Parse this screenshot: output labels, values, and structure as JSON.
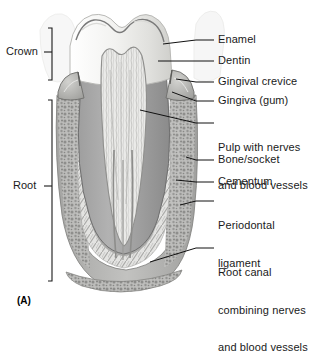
{
  "figure": {
    "id": "(A)",
    "background": "#ffffff"
  },
  "brackets": [
    {
      "name": "crown",
      "label": "Crown",
      "top": 28,
      "bottom": 80,
      "x": 52,
      "label_x": 6,
      "label_y": 48
    },
    {
      "name": "root",
      "label": "Root",
      "top": 100,
      "bottom": 281,
      "x": 52,
      "label_x": 11,
      "label_y": 185
    }
  ],
  "labels": [
    {
      "name": "enamel",
      "lines": [
        "Enamel"
      ],
      "x": 218,
      "y": 36,
      "leader": [
        [
          196,
          40
        ],
        [
          214,
          40
        ]
      ],
      "tip": [
        163,
        44
      ]
    },
    {
      "name": "dentin",
      "lines": [
        "Dentin"
      ],
      "x": 218,
      "y": 57,
      "leader": [
        [
          196,
          61
        ],
        [
          214,
          61
        ]
      ],
      "tip": [
        158,
        61
      ]
    },
    {
      "name": "gingival-crevice",
      "lines": [
        "Gingival crevice"
      ],
      "x": 218,
      "y": 78,
      "leader": [
        [
          196,
          82
        ],
        [
          214,
          82
        ]
      ],
      "tip": [
        172,
        79
      ]
    },
    {
      "name": "gingiva-gum",
      "lines": [
        "Gingiva (gum)"
      ],
      "x": 218,
      "y": 97,
      "leader": [
        [
          196,
          101
        ],
        [
          214,
          101
        ]
      ],
      "tip": [
        170,
        92
      ]
    },
    {
      "name": "pulp",
      "lines": [
        "Pulp with nerves",
        "and blood vessels"
      ],
      "x": 218,
      "y": 119,
      "leader": [
        [
          196,
          123
        ],
        [
          214,
          123
        ]
      ],
      "tip": [
        140,
        110
      ]
    },
    {
      "name": "bone-socket",
      "lines": [
        "Bone/socket"
      ],
      "x": 218,
      "y": 156,
      "leader": [
        [
          196,
          160
        ],
        [
          214,
          160
        ]
      ],
      "tip": [
        185,
        157
      ]
    },
    {
      "name": "cementum",
      "lines": [
        "Cementum"
      ],
      "x": 218,
      "y": 178,
      "leader": [
        [
          196,
          182
        ],
        [
          214,
          182
        ]
      ],
      "tip": [
        176,
        180
      ]
    },
    {
      "name": "periodontal-ligament",
      "lines": [
        "Periodontal",
        "ligament"
      ],
      "x": 218,
      "y": 197,
      "leader": [
        [
          196,
          201
        ],
        [
          214,
          201
        ]
      ],
      "tip": [
        180,
        204
      ]
    },
    {
      "name": "root-canal",
      "lines": [
        "Root canal",
        "combining nerves",
        "and blood vessels"
      ],
      "x": 218,
      "y": 244,
      "leader": [
        [
          196,
          248
        ],
        [
          214,
          248
        ]
      ],
      "tip": [
        150,
        262
      ]
    }
  ],
  "anatomy": {
    "colors": {
      "enamel": "#efefed",
      "enamel_shade": "#d9d9d6",
      "dentin": "#a9a9a9",
      "dentin_dark": "#8e8e8e",
      "pulp": "#e8e8e6",
      "gingiva": "#c0c0bd",
      "bone": "#b4b4b2",
      "bone_dark": "#8a8a88",
      "ligament": "#dcdcda",
      "outline": "#4a4a4a",
      "leader": "#111111",
      "ghost": "#ededec"
    },
    "parts": [
      "enamel",
      "dentin",
      "pulp-chamber",
      "gingiva",
      "gingival-crevice",
      "cementum",
      "periodontal-ligament",
      "alveolar-bone",
      "root-canal",
      "neighbor-tooth-ghost"
    ]
  }
}
